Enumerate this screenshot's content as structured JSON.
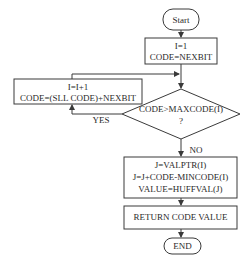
{
  "flowchart": {
    "start": {
      "label": "Start"
    },
    "init": {
      "lines": [
        "I=1",
        "CODE=NEXBIT"
      ]
    },
    "loop_body": {
      "lines": [
        "I=I+1",
        "CODE=(SLL CODE)+NEXBIT"
      ]
    },
    "decision": {
      "lines": [
        "CODE>MAXCODE(I)",
        "?"
      ]
    },
    "branch_yes": {
      "label": "YES"
    },
    "branch_no": {
      "label": "NO"
    },
    "compute": {
      "lines": [
        "J=VALPTR(I)",
        "J=J+CODE-MINCODE(I)",
        "VALUE=HUFFVAL(J)"
      ]
    },
    "return": {
      "label": "RETURN CODE VALUE"
    },
    "end": {
      "label": "END"
    }
  }
}
